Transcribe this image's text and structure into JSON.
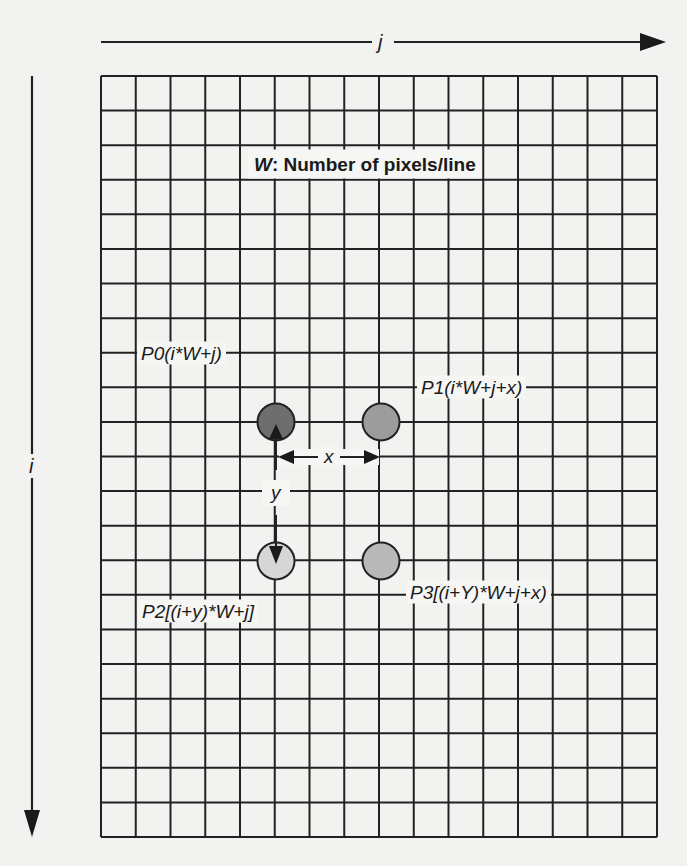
{
  "diagram": {
    "title_var": "W",
    "title_text": ": Number of pixels/line",
    "axes": {
      "horizontal": {
        "label": "j"
      },
      "vertical": {
        "label": "i"
      }
    },
    "grid": {
      "columns": 16,
      "rows": 22
    },
    "offsets": {
      "x_label": "x",
      "y_label": "y"
    },
    "points": [
      {
        "id": "P0",
        "label": "P0(i*W+j)",
        "color": "#6e6e6e"
      },
      {
        "id": "P1",
        "label": "P1(i*W+j+x)",
        "color": "#9c9c9c"
      },
      {
        "id": "P2",
        "label": "P2[(i+y)*W+j]",
        "color": "#d6d6d6"
      },
      {
        "id": "P3",
        "label": "P3[(i+Y)*W+j+x)",
        "color": "#b9b9b9"
      }
    ],
    "colors": {
      "line": "#222222",
      "background": "#f2f2f0"
    }
  }
}
